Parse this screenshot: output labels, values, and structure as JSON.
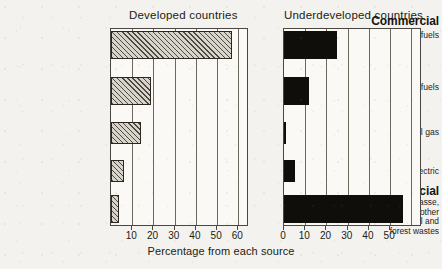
{
  "figure": {
    "axis_caption": "Percentage from each source",
    "panels": [
      {
        "key": "developed",
        "title": "Developed countries"
      },
      {
        "key": "underdeveloped",
        "title": "Underdeveloped countries"
      }
    ],
    "group_headings": {
      "commercial": "Commercial",
      "non_commercial": "Non-commercial"
    },
    "category_labels": {
      "solid_fuels": "Solid fuels",
      "liquid_fuels": "Liquid fuels",
      "natural_gas": "Natural gas",
      "hydro_electric": "Hydro-electric",
      "wood_line1": "Wood, peat, bagasse,",
      "wood_line2": "manure and other",
      "wood_line3": "agricultural and",
      "wood_line4": "forest wastes"
    },
    "tick_labels_left": [
      "10",
      "20",
      "30",
      "40",
      "50",
      "60"
    ],
    "tick_labels_right": [
      "0",
      "10",
      "20",
      "30",
      "40",
      "50"
    ],
    "colors": {
      "paper": "#f3f2ee",
      "plot_background": "#faf9f5",
      "axis": "#4b4740",
      "gridline": "#6d675d",
      "hatch_bar": "#d7d4cc",
      "solid_bar": "#100e0b",
      "text": "#17140f"
    }
  },
  "chart_data": {
    "type": "bar",
    "title": "",
    "xlabel": "Percentage from each source",
    "ylabel": "",
    "orientation": "horizontal",
    "grid": true,
    "legend": "none",
    "panels": [
      {
        "name": "Developed countries",
        "xlim": [
          0,
          65
        ],
        "xticks": [
          10,
          20,
          30,
          40,
          50,
          60
        ],
        "fill": "hatched",
        "categories": [
          "Solid fuels",
          "Liquid fuels",
          "Natural gas",
          "Hydro-electric",
          "Wood, peat, bagasse, manure and other agricultural and forest wastes"
        ],
        "values": [
          57,
          19,
          14,
          6,
          4
        ]
      },
      {
        "name": "Underdeveloped countries",
        "xlim": [
          0,
          65
        ],
        "xticks": [
          0,
          10,
          20,
          30,
          40,
          50
        ],
        "fill": "solid",
        "categories": [
          "Solid fuels",
          "Liquid fuels",
          "Natural gas",
          "Hydro-electric",
          "Wood, peat, bagasse, manure and other agricultural and forest wastes"
        ],
        "values": [
          25,
          12,
          1,
          5,
          56
        ]
      }
    ],
    "groups": [
      {
        "label": "Commercial",
        "categories": [
          "Solid fuels",
          "Liquid fuels",
          "Natural gas",
          "Hydro-electric"
        ]
      },
      {
        "label": "Non-commercial",
        "categories": [
          "Wood, peat, bagasse, manure and other agricultural and forest wastes"
        ]
      }
    ]
  }
}
